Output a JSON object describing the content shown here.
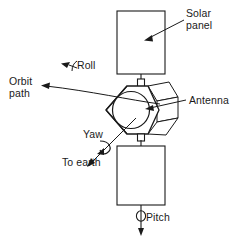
{
  "figure": {
    "kind": "satellite-attitude-diagram",
    "stroke_color": "#1a1a1a",
    "background_color": "#ffffff"
  },
  "labels": {
    "solar_panel": "Solar\npanel",
    "orbit_path": "Orbit\npath",
    "roll": "Roll",
    "antenna": "Antenna",
    "yaw": "Yaw",
    "to_earth": "To earth",
    "pitch": "Pitch"
  },
  "parts": {
    "upper_solar_panel": "upper-solar-panel",
    "lower_solar_panel": "lower-solar-panel",
    "spacecraft_body": "hexagonal-spacecraft-body",
    "antenna_dish": "circular-antenna-dish",
    "upper_mast": "upper-mast-connector",
    "lower_mast": "lower-mast-connector"
  },
  "axes": {
    "roll": "Roll",
    "yaw": "Yaw",
    "pitch": "Pitch"
  }
}
